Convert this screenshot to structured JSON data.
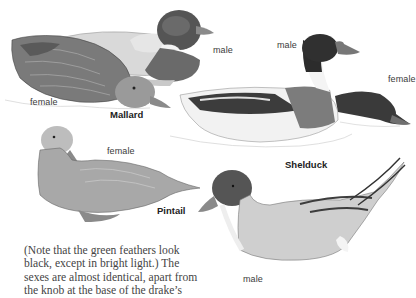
{
  "figure": {
    "species": [
      {
        "name": "Mallard",
        "labels": [
          "male",
          "female"
        ]
      },
      {
        "name": "Shelduck",
        "labels": [
          "male",
          "female"
        ]
      },
      {
        "name": "Pintail",
        "labels": [
          "female",
          "male"
        ]
      }
    ],
    "labels": {
      "mallard_male": "male",
      "mallard_female": "female",
      "mallard_name": "Mallard",
      "shelduck_male": "male",
      "shelduck_female": "female",
      "shelduck_name": "Shelduck",
      "pintail_female": "female",
      "pintail_name": "Pintail",
      "pintail_male": "male"
    }
  },
  "caption": {
    "lines": [
      "(Note that the green feathers look",
      "black, except in bright light.) The",
      "sexes are almost identical, apart from",
      "the knob at the base of the drake’s"
    ]
  },
  "colors": {
    "background": "#ffffff",
    "text": "#444444",
    "label": "#3a3a3a"
  }
}
